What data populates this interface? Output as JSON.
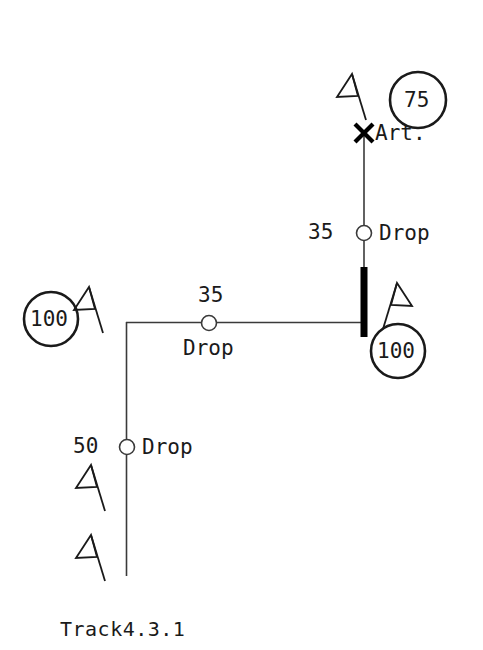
{
  "diagram": {
    "title": "Track4.3.1",
    "caption": "Track4.3.1",
    "line_color": "#3a3a3a",
    "text_color": "#1a1a1a",
    "bar_color": "#000000",
    "background": "#ffffff",
    "nodes": [
      {
        "id": "node-75",
        "type": "circle-node",
        "label": "75",
        "cx": 418,
        "cy": 100,
        "r": 28
      },
      {
        "id": "node-100-right",
        "type": "circle-node",
        "label": "100",
        "cx": 398,
        "cy": 351,
        "r": 27
      },
      {
        "id": "node-100-left",
        "type": "circle-node",
        "label": "100",
        "cx": 51,
        "cy": 319,
        "r": 27
      }
    ],
    "markers": [
      {
        "id": "marker-art",
        "type": "cross-marker",
        "label": "Art.",
        "x": 364,
        "y": 133
      },
      {
        "id": "drop-top",
        "type": "drop-marker",
        "label": "Drop",
        "speed": "35",
        "x": 364,
        "y": 233
      },
      {
        "id": "drop-middle",
        "type": "drop-marker",
        "label": "Drop",
        "speed": "35",
        "x": 209,
        "y": 323
      },
      {
        "id": "drop-bottom",
        "type": "drop-marker",
        "label": "Drop",
        "speed": "50",
        "x": 127,
        "y": 447
      }
    ],
    "bar": {
      "id": "thick-bar",
      "x": 364,
      "y_top": 267,
      "y_bottom": 337,
      "width": 7
    },
    "flags": [
      {
        "id": "flag-top",
        "orientation": "left",
        "x": 350,
        "y": 75
      },
      {
        "id": "flag-right-100",
        "orientation": "right",
        "x": 400,
        "y": 285
      },
      {
        "id": "flag-left-100",
        "orientation": "left",
        "x": 86,
        "y": 288
      },
      {
        "id": "flag-lower-1",
        "orientation": "left",
        "x": 88,
        "y": 465
      },
      {
        "id": "flag-lower-2",
        "orientation": "left",
        "x": 88,
        "y": 535
      }
    ],
    "labels": {
      "art": "Art.",
      "drop": "Drop",
      "speed_35_top": "35",
      "speed_35_mid": "35",
      "speed_50": "50",
      "node_75": "75",
      "node_100_right": "100",
      "node_100_left": "100"
    }
  }
}
